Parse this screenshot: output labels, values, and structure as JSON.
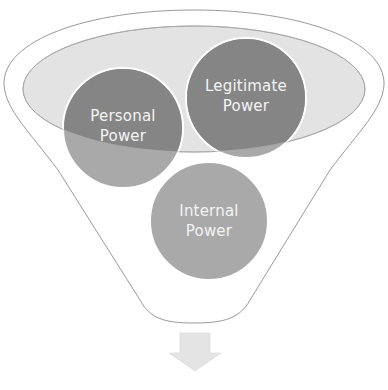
{
  "diagram": {
    "type": "funnel",
    "colors": {
      "background": "#ffffff",
      "funnel_outline": "#9a9a9a",
      "funnel_mouth_fill": "#e3e3e3",
      "circle_fill_light": "#a9a9a9",
      "circle_fill_dark": "#858585",
      "label_text": "#f4f4f4",
      "arrow_fill": "#e4e4e4"
    },
    "circles": [
      {
        "id": "personal-power",
        "line1": "Personal",
        "line2": "Power"
      },
      {
        "id": "legitimate-power",
        "line1": "Legitimate",
        "line2": "Power"
      },
      {
        "id": "internal-power",
        "line1": "Internal",
        "line2": "Power"
      }
    ],
    "arrow": {
      "direction": "down",
      "icon": "arrow-down-icon"
    }
  }
}
